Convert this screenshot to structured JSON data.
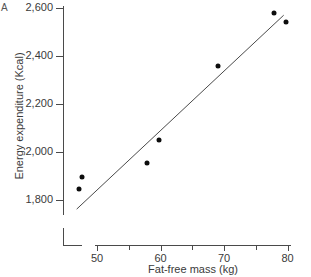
{
  "figure": {
    "corner_label": "A",
    "background": "#ffffff",
    "point_color": "#0d0d0d",
    "axis_color": "#4a4a4a"
  },
  "chart_data": {
    "type": "scatter",
    "title": "",
    "xlabel": "Fat-free mass (kg)",
    "ylabel": "Energy expenditure (Kcal)",
    "xlim": [
      46,
      81
    ],
    "ylim": [
      1740,
      2620
    ],
    "grid": false,
    "legend": "none",
    "x_major_ticks": [
      50,
      60,
      70,
      80
    ],
    "x_minor_ticks": [
      55,
      65,
      75
    ],
    "x_tick_labels": [
      "50",
      "60",
      "70",
      "80"
    ],
    "y_major_ticks": [
      1800,
      2000,
      2200,
      2400,
      2600
    ],
    "y_tick_labels": [
      "1,800",
      "2,000",
      "2,200",
      "2,400",
      "2,600"
    ],
    "y_axis_break": true,
    "x": [
      47.1,
      47.7,
      57.9,
      59.7,
      69.0,
      77.8,
      79.7
    ],
    "y": [
      1846,
      1896,
      1954,
      2050,
      2358,
      2579,
      2542
    ],
    "points": [
      {
        "x": 47.1,
        "y": 1846
      },
      {
        "x": 47.7,
        "y": 1896
      },
      {
        "x": 57.9,
        "y": 1954
      },
      {
        "x": 59.7,
        "y": 2050
      },
      {
        "x": 69.0,
        "y": 2358
      },
      {
        "x": 77.8,
        "y": 2579
      },
      {
        "x": 79.7,
        "y": 2542
      }
    ],
    "series": [
      {
        "name": "observations",
        "type": "scatter",
        "values": [
          1846,
          1896,
          1954,
          2050,
          2358,
          2579,
          2542
        ]
      },
      {
        "name": "regression line",
        "type": "line",
        "x_endpoints": [
          46.8,
          79.4
        ],
        "y_endpoints": [
          1762,
          2570
        ]
      }
    ]
  }
}
